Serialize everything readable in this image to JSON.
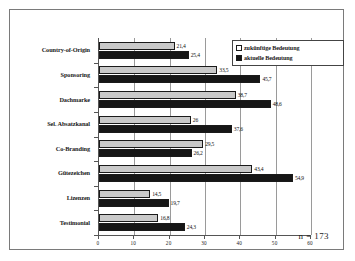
{
  "chart_data": {
    "type": "bar",
    "orientation": "horizontal",
    "title": "",
    "xlabel": "",
    "ylabel": "",
    "xlim": [
      0,
      60
    ],
    "xticks": [
      0,
      10,
      20,
      30,
      40,
      50,
      60
    ],
    "xtick_labels": [
      "0",
      "10",
      "20",
      "30",
      "40",
      "50",
      "60"
    ],
    "grid": true,
    "grid_axis": "x",
    "legend_position": "top-right",
    "decimal_separator": ",",
    "categories": [
      "Country-of-Origin",
      "Sponsoring",
      "Dachmarke",
      "Sel. Absatzkanal",
      "Co-Branding",
      "Gütezeichen",
      "Lizenzen",
      "Testimonial"
    ],
    "series": [
      {
        "name": "zukünftige Bedeutung",
        "color": "#c9c9c9",
        "values": [
          21.4,
          33.5,
          38.7,
          26.0,
          29.5,
          43.4,
          14.5,
          16.8
        ],
        "labels": [
          "21,4",
          "33,5",
          "38,7",
          "26",
          "29,5",
          "43,4",
          "14,5",
          "16,8"
        ]
      },
      {
        "name": "aktuelle Bedeutung",
        "color": "#161616",
        "values": [
          25.4,
          45.7,
          48.6,
          37.6,
          26.2,
          54.9,
          19.7,
          24.3
        ],
        "labels": [
          "25,4",
          "45,7",
          "48,6",
          "37,6",
          "26,2",
          "54,9",
          "19,7",
          "24,3"
        ]
      }
    ],
    "annotation": "n = 173"
  },
  "legend": {
    "items": [
      {
        "label": "zukünftige Bedeutung"
      },
      {
        "label": "aktuelle Bedeutung"
      }
    ]
  },
  "footnote": {
    "text": "n = 173"
  }
}
